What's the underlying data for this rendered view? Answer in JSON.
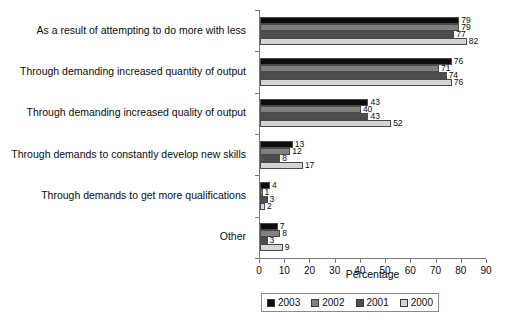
{
  "chart_data": {
    "type": "bar",
    "orientation": "horizontal",
    "title": "",
    "xlabel": "Percentage",
    "ylabel": "",
    "xlim": [
      0,
      90
    ],
    "xticks": [
      0,
      10,
      20,
      30,
      40,
      50,
      60,
      70,
      80,
      90
    ],
    "grid": false,
    "legend_position": "bottom",
    "categories": [
      "As a result of attempting to do more with less",
      "Through demanding increased quantity of output",
      "Through demanding increased quality of output",
      "Through demands to constantly develop new skills",
      "Through demands to get more qualifications",
      "Other"
    ],
    "series": [
      {
        "name": "2003",
        "color": "#0d0d0d",
        "values": [
          79,
          76,
          43,
          13,
          4,
          7
        ]
      },
      {
        "name": "2002",
        "color": "#808080",
        "values": [
          79,
          71,
          40,
          12,
          1,
          8
        ]
      },
      {
        "name": "2001",
        "color": "#4d4d4d",
        "values": [
          77,
          74,
          43,
          8,
          3,
          3
        ]
      },
      {
        "name": "2000",
        "color": "#d4d4d4",
        "values": [
          82,
          76,
          52,
          17,
          2,
          9
        ]
      }
    ]
  },
  "axis": {
    "x_title": "Percentage",
    "tick_labels": [
      "0",
      "10",
      "20",
      "30",
      "40",
      "50",
      "60",
      "70",
      "80",
      "90"
    ]
  },
  "legend": {
    "entries": [
      {
        "label": "2003",
        "color": "#0d0d0d"
      },
      {
        "label": "2002",
        "color": "#808080"
      },
      {
        "label": "2001",
        "color": "#4d4d4d"
      },
      {
        "label": "2000",
        "color": "#d4d4d4"
      }
    ]
  }
}
